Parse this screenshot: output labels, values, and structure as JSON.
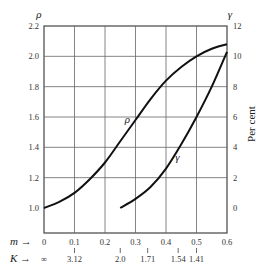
{
  "chart_data": {
    "type": "line",
    "title": "",
    "xlabel": "m",
    "x_secondary_label": "K",
    "ylabel_left": "ρ",
    "ylabel_right": "γ",
    "ylabel_right_unit": "Per cent",
    "xlim": [
      0,
      0.6
    ],
    "ylim_left": [
      1.0,
      2.2
    ],
    "ylim_right": [
      -2,
      12
    ],
    "grid": true,
    "x_ticks": [
      "0",
      "0.1",
      "0.2",
      "0.3",
      "0.4",
      "0.5",
      "0.6"
    ],
    "x_ticks_values": [
      0,
      0.1,
      0.2,
      0.3,
      0.4,
      0.5,
      0.6
    ],
    "k_ticks": [
      {
        "label": "∞",
        "m": 0
      },
      {
        "label": "3.12",
        "m": 0.1
      },
      {
        "label": "2.0",
        "m": 0.25
      },
      {
        "label": "1.71",
        "m": 0.34
      },
      {
        "label": "1.54",
        "m": 0.44
      },
      {
        "label": "1.41",
        "m": 0.5
      }
    ],
    "y_left_ticks": [
      "1.0",
      "1.2",
      "1.4",
      "1.6",
      "1.8",
      "2.0",
      "2.2"
    ],
    "y_right_ticks": [
      "0",
      "2",
      "4",
      "6",
      "8",
      "10",
      "12"
    ],
    "series": [
      {
        "name": "ρ",
        "axis": "left",
        "x": [
          0,
          0.05,
          0.1,
          0.15,
          0.2,
          0.25,
          0.3,
          0.35,
          0.4,
          0.45,
          0.5,
          0.55,
          0.6
        ],
        "values": [
          1.0,
          1.04,
          1.1,
          1.19,
          1.3,
          1.44,
          1.58,
          1.72,
          1.84,
          1.93,
          2.0,
          2.05,
          2.08
        ]
      },
      {
        "name": "γ",
        "axis": "right",
        "x": [
          0.25,
          0.3,
          0.35,
          0.4,
          0.45,
          0.5,
          0.55,
          0.6
        ],
        "values": [
          0,
          0.6,
          1.4,
          2.6,
          4.2,
          6.0,
          8.0,
          10.3
        ]
      }
    ]
  },
  "labels": {
    "rho": "ρ",
    "gamma": "γ",
    "per_cent": "Per cent",
    "m_axis": "m →",
    "k_axis": "K →",
    "rho_curve_label": "ρ",
    "gamma_curve_label": "γ"
  }
}
